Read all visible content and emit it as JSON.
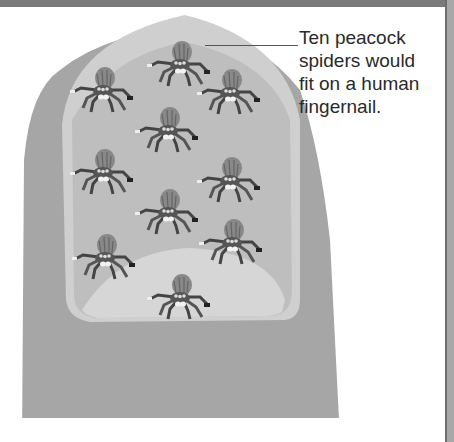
{
  "figure": {
    "caption": "Ten peacock spiders would fit on a human fingernail.",
    "caption_lines": [
      "Ten peacock",
      "spiders would",
      "fit on a human",
      "fingernail."
    ],
    "spider_count": 10,
    "colors": {
      "finger": "#a6a6a6",
      "nail_outer": "#cfcfcf",
      "nail_inner": "#bebebe",
      "nail_moon": "#d6d6d6",
      "frame_top": "#7a7a7a",
      "frame_right": "#a8a8a8"
    }
  }
}
